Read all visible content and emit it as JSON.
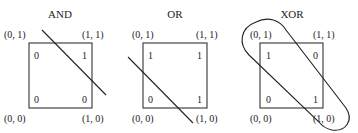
{
  "panels": [
    {
      "title": "AND",
      "corners": {
        "top_left": "(0, 1)",
        "top_right": "(1, 1)",
        "bottom_left": "(0, 0)",
        "bottom_right": "(1, 0)"
      },
      "values": {
        "top_left": "0",
        "top_right": "1",
        "bottom_left": "0",
        "bottom_right": "0"
      },
      "separator": "line"
    },
    {
      "title": "OR",
      "corners": {
        "top_left": "(0, 1)",
        "top_right": "(1, 1)",
        "bottom_left": "(0, 0)",
        "bottom_right": "(1, 0)"
      },
      "values": {
        "top_left": "1",
        "top_right": "1",
        "bottom_left": "0",
        "bottom_right": "1"
      },
      "separator": "line"
    },
    {
      "title": "XOR",
      "corners": {
        "top_left": "(0, 1)",
        "top_right": "(1, 1)",
        "bottom_left": "(0, 0)",
        "bottom_right": "(1, 0)"
      },
      "values": {
        "top_left": "1",
        "top_right": "0",
        "bottom_left": "0",
        "bottom_right": "1"
      },
      "separator": "capsule"
    }
  ]
}
